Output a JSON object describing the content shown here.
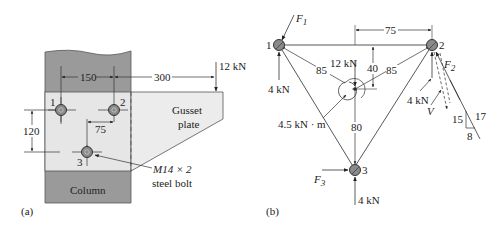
{
  "figure_a": {
    "caption": "(a)",
    "dims": {
      "d150": "150",
      "d300": "300",
      "d120": "120",
      "d75": "75"
    },
    "load": "12 kN",
    "bolts": [
      "1",
      "2",
      "3"
    ],
    "gusset_label_1": "Gusset",
    "gusset_label_2": "plate",
    "column_label": "Column",
    "bolt_spec_1": "M14 × 2",
    "bolt_spec_2": "steel bolt",
    "colors": {
      "column": "#9a9a9a",
      "plate": "#e6e6e6",
      "bolt": "#8a8a8a"
    }
  },
  "figure_b": {
    "caption": "(b)",
    "nodes": [
      "1",
      "2",
      "3"
    ],
    "forces": {
      "F1": "F",
      "F1_sub": "1",
      "F2": "F",
      "F2_sub": "2",
      "F3": "F",
      "F3_sub": "3",
      "V": "V"
    },
    "loads": {
      "node1": "4 kN",
      "node2": "4 kN",
      "node3": "4 kN",
      "center": "12 kN",
      "moment": "4.5 kN · m"
    },
    "dims": {
      "d75": "75",
      "d40": "40",
      "d85a": "85",
      "d85b": "85",
      "d80": "80"
    },
    "slope": {
      "rise": "15",
      "hyp": "17",
      "run": "8"
    }
  }
}
